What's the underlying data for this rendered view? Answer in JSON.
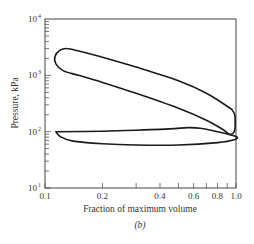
{
  "chart_data": {
    "type": "line",
    "title": "",
    "caption": "(b)",
    "xlabel": "Fraction of maximum volume",
    "ylabel": "Pressure, kPa",
    "xscale": "log",
    "yscale": "log",
    "xlim": [
      0.1,
      1.0
    ],
    "ylim": [
      10,
      10000
    ],
    "grid": false,
    "legend": null,
    "x_tick_labels": [
      "0.1",
      "0.2",
      "0.4",
      "0.6",
      "0.8",
      "1.0"
    ],
    "x_minor_ticks": [
      0.3,
      0.5,
      0.7,
      0.9
    ],
    "y_tick_labels": [
      {
        "base": "10",
        "exp": "1",
        "value": 10
      },
      {
        "base": "10",
        "exp": "2",
        "value": 100
      },
      {
        "base": "10",
        "exp": "3",
        "value": 1000
      },
      {
        "base": "10",
        "exp": "4",
        "value": 10000
      }
    ],
    "series": [
      {
        "name": "high-pressure loop (compression/expansion)",
        "closed": true,
        "points": [
          [
            0.95,
            250
          ],
          [
            0.7,
            480
          ],
          [
            0.5,
            800
          ],
          [
            0.3,
            1400
          ],
          [
            0.2,
            2100
          ],
          [
            0.15,
            2700
          ],
          [
            0.13,
            3000
          ],
          [
            0.12,
            2800
          ],
          [
            0.113,
            2200
          ],
          [
            0.114,
            1600
          ],
          [
            0.125,
            1200
          ],
          [
            0.15,
            1000
          ],
          [
            0.2,
            750
          ],
          [
            0.3,
            480
          ],
          [
            0.5,
            260
          ],
          [
            0.7,
            160
          ],
          [
            0.85,
            110
          ],
          [
            0.93,
            90
          ],
          [
            0.98,
            100
          ],
          [
            0.99,
            140
          ],
          [
            0.985,
            200
          ],
          [
            0.95,
            250
          ]
        ]
      },
      {
        "name": "low-pressure loop (exhaust/intake)",
        "closed": true,
        "points": [
          [
            0.114,
            100
          ],
          [
            0.2,
            102
          ],
          [
            0.3,
            106
          ],
          [
            0.45,
            112
          ],
          [
            0.56,
            118
          ],
          [
            0.65,
            115
          ],
          [
            0.8,
            100
          ],
          [
            1.0,
            82
          ],
          [
            0.98,
            72
          ],
          [
            0.8,
            64
          ],
          [
            0.5,
            58
          ],
          [
            0.3,
            58
          ],
          [
            0.2,
            61
          ],
          [
            0.14,
            68
          ],
          [
            0.12,
            82
          ],
          [
            0.114,
            100
          ]
        ]
      }
    ]
  }
}
